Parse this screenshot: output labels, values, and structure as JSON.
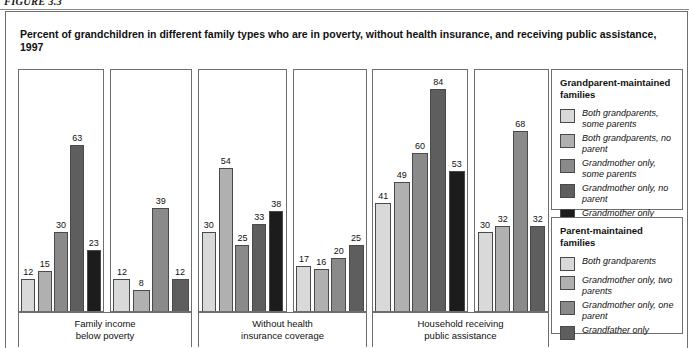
{
  "figure": {
    "label": "FIGURE 3.3"
  },
  "chart_title": "Percent of grandchildren in different family types who are in poverty, without health insurance, and receiving public assistance, 1997",
  "legend": {
    "grandparent": {
      "heading": "Grandparent-maintained families",
      "items": [
        {
          "label": "Both grandparents, some parents",
          "color": "#d9d9d9"
        },
        {
          "label": "Both grandparents, no parent",
          "color": "#b0b0b0"
        },
        {
          "label": "Grandmother only, some  parents",
          "color": "#8a8a8a"
        },
        {
          "label": "Grandmother only, no parent",
          "color": "#5e5e5e"
        },
        {
          "label": "Grandmother only",
          "color": "#1c1c1c"
        }
      ]
    },
    "parent": {
      "heading": "Parent-maintained families",
      "items": [
        {
          "label": "Both grandparents",
          "color": "#d9d9d9"
        },
        {
          "label": "Grandmother only, two parents",
          "color": "#b0b0b0"
        },
        {
          "label": "Grandmother only, one parent",
          "color": "#8a8a8a"
        },
        {
          "label": "Grandfather only",
          "color": "#5e5e5e"
        }
      ]
    }
  },
  "chart_data": {
    "type": "bar",
    "title": "Percent of grandchildren in different family types who are in poverty, without health insurance, and receiving public assistance, 1997",
    "xlabel": "",
    "ylabel": "Percent",
    "ylim": [
      0,
      92
    ],
    "grid": false,
    "legend_position": "right",
    "categories": [
      "Family income below poverty",
      "Without health insurance coverage",
      "Household receiving public assistance"
    ],
    "panels": [
      {
        "caption_line1": "Family income",
        "caption_line2": "below poverty",
        "groups": [
          {
            "family_type": "Grandparent-maintained families",
            "series": [
              {
                "name": "Both grandparents, some parents",
                "value": 12,
                "color": "#d9d9d9"
              },
              {
                "name": "Both grandparents, no parent",
                "value": 15,
                "color": "#b0b0b0"
              },
              {
                "name": "Grandmother only, some parents",
                "value": 30,
                "color": "#8a8a8a"
              },
              {
                "name": "Grandmother only, no parent",
                "value": 63,
                "color": "#5e5e5e"
              },
              {
                "name": "Grandmother only",
                "value": 23,
                "color": "#1c1c1c"
              }
            ]
          },
          {
            "family_type": "Parent-maintained families",
            "series": [
              {
                "name": "Both grandparents",
                "value": 12,
                "color": "#d9d9d9"
              },
              {
                "name": "Grandmother only, two parents",
                "value": 8,
                "color": "#b0b0b0"
              },
              {
                "name": "Grandmother only, one parent",
                "value": 39,
                "color": "#8a8a8a"
              },
              {
                "name": "Grandfather only",
                "value": 12,
                "color": "#5e5e5e"
              }
            ]
          }
        ]
      },
      {
        "caption_line1": "Without health",
        "caption_line2": "insurance coverage",
        "groups": [
          {
            "family_type": "Grandparent-maintained families",
            "series": [
              {
                "name": "Both grandparents, some parents",
                "value": 30,
                "color": "#d9d9d9"
              },
              {
                "name": "Both grandparents, no parent",
                "value": 54,
                "color": "#b0b0b0"
              },
              {
                "name": "Grandmother only, some parents",
                "value": 25,
                "color": "#8a8a8a"
              },
              {
                "name": "Grandmother only, no parent",
                "value": 33,
                "color": "#5e5e5e"
              },
              {
                "name": "Grandmother only",
                "value": 38,
                "color": "#1c1c1c"
              }
            ]
          },
          {
            "family_type": "Parent-maintained families",
            "series": [
              {
                "name": "Both grandparents",
                "value": 17,
                "color": "#d9d9d9"
              },
              {
                "name": "Grandmother only, two parents",
                "value": 16,
                "color": "#b0b0b0"
              },
              {
                "name": "Grandmother only, one parent",
                "value": 20,
                "color": "#8a8a8a"
              },
              {
                "name": "Grandfather only",
                "value": 25,
                "color": "#5e5e5e"
              }
            ]
          }
        ]
      },
      {
        "caption_line1": "Household receiving",
        "caption_line2": "public  assistance",
        "groups": [
          {
            "family_type": "Grandparent-maintained families",
            "series": [
              {
                "name": "Both grandparents, some parents",
                "value": 41,
                "color": "#d9d9d9"
              },
              {
                "name": "Both grandparents, no parent",
                "value": 49,
                "color": "#b0b0b0"
              },
              {
                "name": "Grandmother only, some parents",
                "value": 60,
                "color": "#8a8a8a"
              },
              {
                "name": "Grandmother only, no parent",
                "value": 84,
                "color": "#5e5e5e"
              },
              {
                "name": "Grandmother only",
                "value": 53,
                "color": "#1c1c1c"
              }
            ]
          },
          {
            "family_type": "Parent-maintained families",
            "series": [
              {
                "name": "Both grandparents",
                "value": 30,
                "color": "#d9d9d9"
              },
              {
                "name": "Grandmother only, two parents",
                "value": 32,
                "color": "#b0b0b0"
              },
              {
                "name": "Grandmother only, one parent",
                "value": 68,
                "color": "#8a8a8a"
              },
              {
                "name": "Grandfather only",
                "value": 32,
                "color": "#5e5e5e"
              }
            ]
          }
        ]
      }
    ]
  }
}
